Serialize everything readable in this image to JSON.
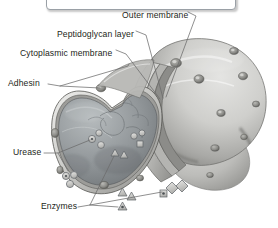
{
  "figure": {
    "background_color": "#ffffff",
    "ink_color": "#231f20",
    "leader_color": "#5a5a5a",
    "body_fill_light": "#d8d8d6",
    "body_fill_mid": "#a9a9a7",
    "body_fill_dark": "#6f6f6e",
    "interior_fill": "#8e9294"
  },
  "top_box": {
    "label": "empty-callout-box",
    "text": "",
    "border_color": "#9aa0a6",
    "fill_color": "#ffffff"
  },
  "labels": [
    {
      "id": "outer-membrane",
      "text": "Outer membrane",
      "x": 122,
      "y": 10
    },
    {
      "id": "peptidoglycan-layer",
      "text": "Peptidoglycan layer",
      "x": 57,
      "y": 29
    },
    {
      "id": "cytoplasmic-membrane",
      "text": "Cytoplasmic membrane",
      "x": 20,
      "y": 48
    },
    {
      "id": "adhesin",
      "text": "Adhesin",
      "x": 8,
      "y": 81
    },
    {
      "id": "urease",
      "text": "Urease",
      "x": 13,
      "y": 151
    },
    {
      "id": "enzymes",
      "text": "Enzymes",
      "x": 41,
      "y": 206
    }
  ],
  "structures": {
    "membrane_layers": [
      "Outer membrane",
      "Peptidoglycan layer",
      "Cytoplasmic membrane"
    ],
    "surface_features": "adhesin bumps",
    "interior_molecules": [
      "urease circles",
      "enzyme triangles",
      "enzyme squares",
      "enzyme diamonds"
    ]
  }
}
